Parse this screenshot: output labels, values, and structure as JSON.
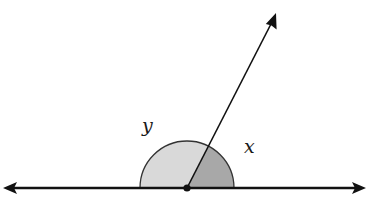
{
  "diagram": {
    "type": "geometry-angles-on-a-line",
    "labels": {
      "angle_left": "y",
      "angle_right": "x"
    },
    "colors": {
      "line": "#111111",
      "region_y_fill": "#d9d9d9",
      "region_x_fill": "#a8a8a8",
      "arc_stroke": "#333333",
      "background": "#ffffff"
    },
    "geometry": {
      "vertex": [
        187,
        188
      ],
      "line_left_tip": [
        3,
        188
      ],
      "line_right_tip": [
        366,
        188
      ],
      "ray_tip": [
        276,
        13
      ],
      "arc_radius": 47
    }
  }
}
